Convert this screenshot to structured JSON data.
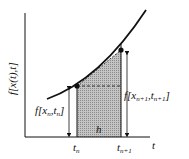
{
  "diagram": {
    "type": "trapezoidal-integration-step",
    "y_axis_label": "f[x(t),t]",
    "x_axis_label": "t",
    "ticks": [
      {
        "id": "tn",
        "base": "t",
        "sub": "n"
      },
      {
        "id": "tn1",
        "base": "t",
        "sub": "n+1"
      }
    ],
    "left_value_label": {
      "prefix": "f[",
      "x": "x",
      "xsub": "n",
      "sep": ",",
      "t": "t",
      "tsub": "n",
      "suffix": "]"
    },
    "right_value_label": {
      "prefix": "f[",
      "x": "x",
      "xsub": "n+1",
      "sep": ",",
      "t": "t",
      "tsub": "n+1",
      "suffix": "]"
    },
    "step_label": "h",
    "colors": {
      "line": "#111111",
      "fill": "#b8b8b8",
      "background": "#ffffff"
    }
  }
}
